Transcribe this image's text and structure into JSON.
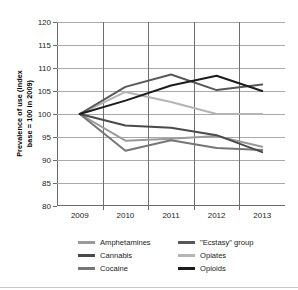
{
  "chart_data": {
    "type": "line",
    "title": "",
    "xlabel": "",
    "ylabel": "Prevalence of use (index\nbase = 100 in 2009)",
    "x": [
      "2009",
      "2010",
      "2011",
      "2012",
      "2013"
    ],
    "categories": [
      "2009",
      "2010",
      "2011",
      "2012",
      "2013"
    ],
    "ylim": [
      80,
      120
    ],
    "yticks": [
      80,
      85,
      90,
      95,
      100,
      105,
      110,
      115,
      120
    ],
    "grid": "horizontal-and-vertical",
    "legend_position": "bottom",
    "series": [
      {
        "name": "Amphetamines",
        "color": "#9a9a9a",
        "values": [
          100,
          94.2,
          94.6,
          95.2,
          92.9
        ]
      },
      {
        "name": "Cannabis",
        "color": "#4a4a4a",
        "values": [
          100,
          97.5,
          97.0,
          95.4,
          91.7
        ]
      },
      {
        "name": "Cocaine",
        "color": "#767676",
        "values": [
          100,
          92.0,
          94.3,
          92.6,
          92.2
        ]
      },
      {
        "name": "\"Ecstasy\" group",
        "color": "#585858",
        "values": [
          100,
          105.9,
          108.6,
          105.2,
          106.4
        ]
      },
      {
        "name": "Opiates",
        "color": "#b4b4b4",
        "values": [
          100,
          104.8,
          102.6,
          100.0,
          100.0
        ]
      },
      {
        "name": "Opioids",
        "color": "#1c1c1c",
        "values": [
          100,
          102.9,
          106.2,
          108.3,
          105.0
        ]
      }
    ]
  },
  "legend": {
    "items": [
      {
        "label": "Amphetamines",
        "color": "#9a9a9a"
      },
      {
        "label": "\"Ecstasy\" group",
        "color": "#585858"
      },
      {
        "label": "Cannabis",
        "color": "#4a4a4a"
      },
      {
        "label": "Opiates",
        "color": "#b4b4b4"
      },
      {
        "label": "Cocaine",
        "color": "#767676"
      },
      {
        "label": "Opioids",
        "color": "#1c1c1c"
      }
    ]
  },
  "axis": {
    "y_title": "Prevalence of use (index\nbase = 100 in 2009)",
    "y_tick_labels": [
      "120",
      "115",
      "110",
      "105",
      "100",
      "95",
      "90",
      "85",
      "80"
    ],
    "x_tick_labels": [
      "2009",
      "2010",
      "2011",
      "2012",
      "2013"
    ]
  }
}
